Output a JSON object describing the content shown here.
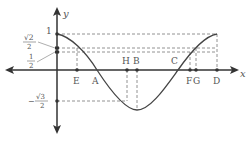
{
  "diagram": {
    "type": "function-graph",
    "function": "cosine-like curve",
    "axes": {
      "x_label": "x",
      "y_label": "y"
    },
    "y_ticks": {
      "one": "1",
      "sqrt2_over_2_num": "√2",
      "sqrt2_over_2_den": "2",
      "half_num": "1",
      "half_den": "2",
      "neg_sqrt3_over_2_sign": "−",
      "neg_sqrt3_over_2_num": "√3",
      "neg_sqrt3_over_2_den": "2"
    },
    "x_points": {
      "E": "E",
      "A": "A",
      "H": "H",
      "B": "B",
      "C": "C",
      "F": "F",
      "G": "G",
      "D": "D"
    }
  }
}
